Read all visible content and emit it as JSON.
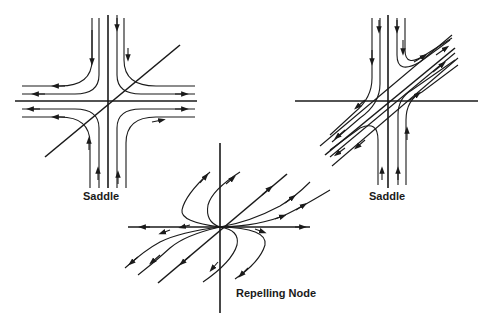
{
  "diagrams": [
    {
      "id": "saddle-1",
      "label": "Saddle",
      "type": "saddle",
      "center": [
        108,
        101
      ]
    },
    {
      "id": "saddle-2",
      "label": "Saddle",
      "type": "saddle",
      "center": [
        388,
        101
      ]
    },
    {
      "id": "repelling-node",
      "label": "Repelling Node",
      "type": "repelling node",
      "center": [
        220,
        227
      ]
    }
  ],
  "colors": {
    "ink": "#1a1a1a",
    "background": "#ffffff"
  }
}
